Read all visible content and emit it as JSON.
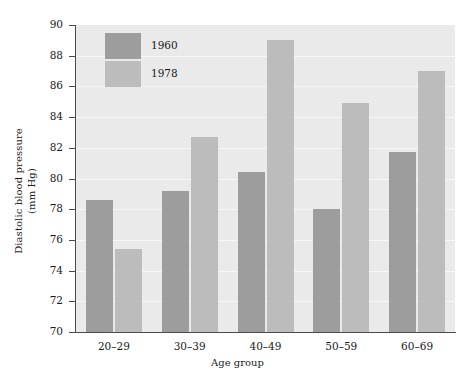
{
  "chart_data": {
    "type": "bar",
    "title": "",
    "xlabel": "Age group",
    "ylabel_line1": "Diastolic blood pressure",
    "ylabel_line2": "(mm Hg)",
    "categories": [
      "20–29",
      "30–39",
      "40–49",
      "50–59",
      "60–69"
    ],
    "series": [
      {
        "name": "1960",
        "color": "#9d9d9d",
        "values": [
          78.6,
          79.2,
          80.4,
          78.0,
          81.7
        ]
      },
      {
        "name": "1978",
        "color": "#bcbcbc",
        "values": [
          75.4,
          82.7,
          89.0,
          84.9,
          87.0
        ]
      }
    ],
    "ylim": [
      70,
      90
    ],
    "yticks": [
      70,
      72,
      74,
      76,
      78,
      80,
      82,
      84,
      86,
      88,
      90
    ],
    "ytick_labels": [
      "70",
      "72",
      "74",
      "76",
      "78",
      "80",
      "82",
      "84",
      "86",
      "88",
      "90"
    ],
    "grid": true,
    "gridlines_at": [
      72,
      74,
      76,
      78,
      80,
      82,
      84,
      86,
      88
    ],
    "legend_position": "top-left-inside",
    "plot_background": "#eaeaea",
    "gridline_color": "#f7f7f7",
    "axis_color": "#4a4a4a",
    "figure_background": "#ffffff"
  }
}
